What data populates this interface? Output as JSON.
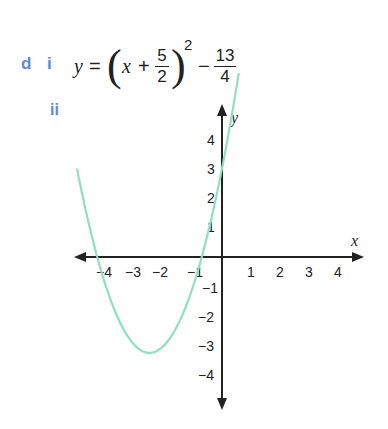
{
  "labels": {
    "part": "d",
    "sub_i": "i",
    "sub_ii": "ii"
  },
  "equation": {
    "lhs": "y",
    "equals": "=",
    "open_paren": "(",
    "x": "x",
    "plus": "+",
    "frac1_num": "5",
    "frac1_den": "2",
    "close_paren": ")",
    "exponent": "2",
    "minus": "−",
    "frac2_num": "13",
    "frac2_den": "4"
  },
  "colors": {
    "label": "#5b8bd9",
    "curve": "#8fe0bf",
    "axis": "#222222"
  },
  "chart_data": {
    "type": "line",
    "xlabel": "x",
    "ylabel": "y",
    "xlim": [
      -5,
      5
    ],
    "ylim": [
      -5,
      5
    ],
    "x_ticks": [
      "−4",
      "−3",
      "−2",
      "−1",
      "1",
      "2",
      "3",
      "4"
    ],
    "y_ticks": [
      "4",
      "3",
      "2",
      "1",
      "−1",
      "−2",
      "−3",
      "−4"
    ],
    "grid": false,
    "series": [
      {
        "name": "y = (x + 5/2)^2 − 13/4",
        "x": [
          -5.0,
          -4.5,
          -4.0,
          -3.5,
          -3.0,
          -2.5,
          -2.0,
          -1.5,
          -1.0,
          -0.5,
          0.0,
          0.5
        ],
        "y": [
          3.0,
          0.75,
          -1.0,
          -2.25,
          -3.0,
          -3.25,
          -3.0,
          -2.25,
          -1.0,
          0.75,
          3.0,
          5.75
        ]
      }
    ],
    "key_points": {
      "vertex": [
        -2.5,
        -3.25
      ],
      "y_intercept": [
        0,
        3
      ],
      "x_intercepts": [
        -4.3,
        -0.7
      ]
    }
  }
}
